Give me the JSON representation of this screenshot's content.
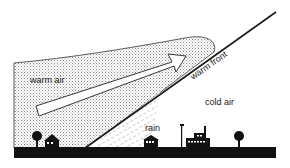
{
  "diagram": {
    "type": "weather-front-cross-section",
    "labels": {
      "warm_air": "warm air",
      "warm_front": "warm front",
      "cold_air": "cold air",
      "rain": "rain"
    },
    "colors": {
      "background": "#ffffff",
      "line": "#1a1a1a",
      "stipple": "#9a9a9a",
      "ground": "#111111",
      "text": "#222222"
    },
    "icons": [
      "tree-icon",
      "house-icon",
      "house-icon",
      "flagpole-icon",
      "factory-icon",
      "tree-icon"
    ]
  }
}
